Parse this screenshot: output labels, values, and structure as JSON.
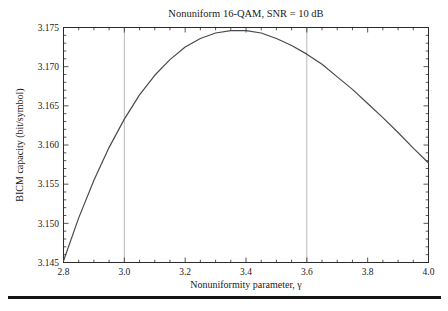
{
  "chart_data": {
    "type": "line",
    "title": "Nonuniform 16-QAM, SNR = 10 dB",
    "xlabel": "Nonuniformity parameter, γ",
    "ylabel": "BICM capacity (bit/symbol)",
    "xlim": [
      2.8,
      4.0
    ],
    "ylim": [
      3.145,
      3.175
    ],
    "xticks": [
      2.8,
      3.0,
      3.2,
      3.4,
      3.6,
      3.8,
      4.0
    ],
    "yticks": [
      3.145,
      3.15,
      3.155,
      3.16,
      3.165,
      3.17,
      3.175
    ],
    "xtick_decimals": 1,
    "ytick_decimals": 3,
    "x_minor_step": 0.05,
    "y_minor_step": 0.001,
    "gridlines_x": [
      3.0,
      3.6
    ],
    "grid_on": true,
    "legend": "none",
    "grid_color": "#b8b8b8",
    "frame_color": "#2b2b2b",
    "line_color": "#4a4a4a",
    "text_color": "#1a1a1a",
    "series": [
      {
        "name": "BICM capacity",
        "points": [
          [
            2.8,
            3.1452
          ],
          [
            2.85,
            3.1507
          ],
          [
            2.9,
            3.1555
          ],
          [
            2.95,
            3.1597
          ],
          [
            3.0,
            3.1633
          ],
          [
            3.05,
            3.1664
          ],
          [
            3.1,
            3.1689
          ],
          [
            3.15,
            3.1709
          ],
          [
            3.2,
            3.1725
          ],
          [
            3.25,
            3.1736
          ],
          [
            3.3,
            3.1743
          ],
          [
            3.35,
            3.1746
          ],
          [
            3.4,
            3.1746
          ],
          [
            3.45,
            3.1743
          ],
          [
            3.5,
            3.1736
          ],
          [
            3.55,
            3.1727
          ],
          [
            3.6,
            3.1716
          ],
          [
            3.65,
            3.1703
          ],
          [
            3.7,
            3.1687
          ],
          [
            3.75,
            3.1671
          ],
          [
            3.8,
            3.1653
          ],
          [
            3.85,
            3.1635
          ],
          [
            3.9,
            3.1616
          ],
          [
            3.95,
            3.1596
          ],
          [
            4.0,
            3.1577
          ]
        ]
      }
    ]
  },
  "page": {
    "rule_color": "#141414"
  }
}
